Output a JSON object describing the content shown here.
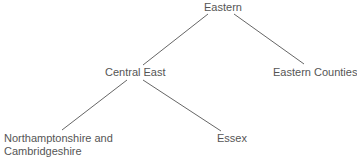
{
  "tree": {
    "nodes": [
      {
        "id": "eastern",
        "label": "Eastern",
        "x": 204,
        "y": 1
      },
      {
        "id": "central-east",
        "label": "Central East",
        "x": 105,
        "y": 66
      },
      {
        "id": "eastern-counties",
        "label": "Eastern Counties",
        "x": 273,
        "y": 66
      },
      {
        "id": "northamptonshire",
        "label": "Northamptonshire and",
        "label2": "Cambridgeshire",
        "x": 4,
        "y": 132
      },
      {
        "id": "essex",
        "label": "Essex",
        "x": 217,
        "y": 132
      }
    ],
    "edges": [
      {
        "from": "eastern",
        "to": "central-east",
        "x1": 208,
        "y1": 14,
        "x2": 143,
        "y2": 65
      },
      {
        "from": "eastern",
        "to": "eastern-counties",
        "x1": 234,
        "y1": 14,
        "x2": 304,
        "y2": 64
      },
      {
        "from": "central-east",
        "to": "northamptonshire",
        "x1": 127,
        "y1": 80,
        "x2": 62,
        "y2": 130
      },
      {
        "from": "central-east",
        "to": "essex",
        "x1": 143,
        "y1": 80,
        "x2": 221,
        "y2": 131
      }
    ]
  },
  "colors": {
    "text": "#555555",
    "line": "#666666",
    "background": "#ffffff"
  }
}
